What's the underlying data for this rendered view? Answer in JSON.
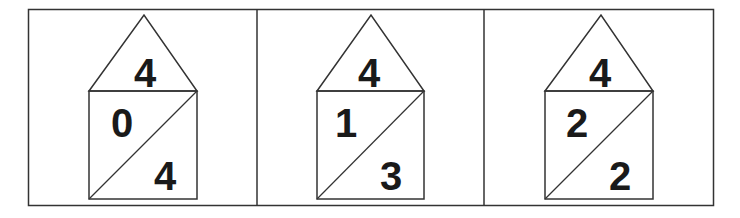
{
  "diagram": {
    "stroke_color": "#333333",
    "panels": [
      {
        "roof": "4",
        "left_part": "0",
        "right_part": "4"
      },
      {
        "roof": "4",
        "left_part": "1",
        "right_part": "3"
      },
      {
        "roof": "4",
        "left_part": "2",
        "right_part": "2"
      }
    ]
  }
}
